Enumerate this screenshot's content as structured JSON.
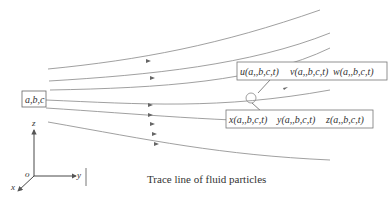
{
  "diagram": {
    "caption": "Trace line of fluid particles",
    "initial_point_label": "a,b,c",
    "velocity_label": {
      "u": "u(a,,b,c,t)",
      "v": "v(a,,b,c,t)",
      "w": "w(a,,b,c,t)"
    },
    "position_label": {
      "x": "x(a,,b,c,t)",
      "y": "y(a,,b,c,t)",
      "z": "z(a,,b,c,t)"
    },
    "axes": {
      "origin": "o",
      "x": "x",
      "y": "y",
      "z": "z"
    },
    "colors": {
      "line": "#777777",
      "text": "#333333"
    }
  }
}
